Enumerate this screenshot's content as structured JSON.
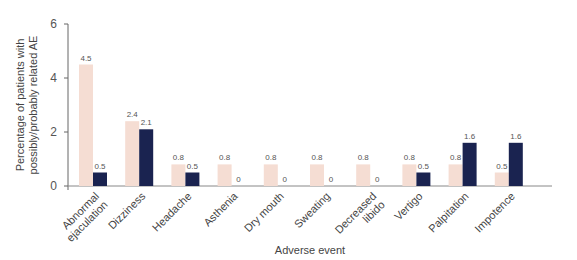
{
  "chart_data": {
    "type": "bar",
    "title": "",
    "xlabel": "Adverse event",
    "ylabel": "Percentage of patients with possibly/probably related AE",
    "ylabel_lines": [
      "Percentage of patients with",
      "possibly/probably related AE"
    ],
    "ylim": [
      0,
      6
    ],
    "yticks": [
      0,
      2,
      4,
      6
    ],
    "grid": false,
    "legend": null,
    "categories": [
      "Abnormal ejaculation",
      "Dizziness",
      "Headache",
      "Asthenia",
      "Dry mouth",
      "Sweating",
      "Decreased libido",
      "Vertigo",
      "Palpitation",
      "Impotence"
    ],
    "category_lines": [
      [
        "Abnormal",
        "ejaculation"
      ],
      [
        "Dizziness"
      ],
      [
        "Headache"
      ],
      [
        "Asthenia"
      ],
      [
        "Dry mouth"
      ],
      [
        "Sweating"
      ],
      [
        "Decreased",
        "libido"
      ],
      [
        "Vertigo"
      ],
      [
        "Palpitation"
      ],
      [
        "Impotence"
      ]
    ],
    "series": [
      {
        "name": "Series 1 (light)",
        "color": "#f5ddd3",
        "values": [
          4.5,
          2.4,
          0.8,
          0.8,
          0.8,
          0.8,
          0.8,
          0.8,
          0.8,
          0.5
        ],
        "labels": [
          "4.5",
          "2.4",
          "0.8",
          "0.8",
          "0.8",
          "0.8",
          "0.8",
          "0.8",
          "0.8",
          "0.5"
        ]
      },
      {
        "name": "Series 2 (dark)",
        "color": "#1a2350",
        "values": [
          0.5,
          2.1,
          0.5,
          0,
          0,
          0,
          0,
          0.5,
          1.6,
          1.6
        ],
        "labels": [
          "0.5",
          "2.1",
          "0.5",
          "0",
          "0",
          "0",
          "0",
          "0.5",
          "1.6",
          "1.6"
        ]
      }
    ]
  }
}
